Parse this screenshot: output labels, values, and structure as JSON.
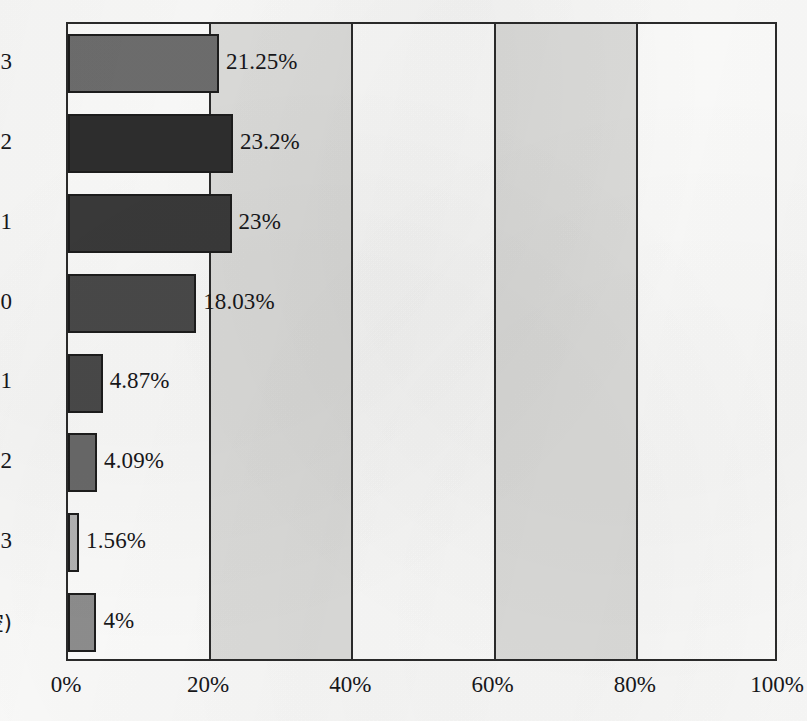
{
  "chart_data": {
    "type": "bar",
    "orientation": "horizontal",
    "title": "",
    "subtitle": "",
    "xlabel": "",
    "ylabel": "",
    "categories": [
      "3",
      "2",
      "1",
      "0",
      "−1",
      "−2",
      "−3",
      "(空)"
    ],
    "values": [
      21.25,
      23.2,
      23.0,
      18.03,
      4.87,
      4.09,
      1.56,
      4.0
    ],
    "data_labels": [
      "21.25%",
      "23.2%",
      "23%",
      "18.03%",
      "4.87%",
      "4.09%",
      "1.56%",
      "4%"
    ],
    "bar_colors": [
      "#6e6e6e",
      "#2e2e2e",
      "#3a3a3a",
      "#4a4a4a",
      "#4a4a4a",
      "#6a6a6a",
      "#b4b4b4",
      "#8e8e8e"
    ],
    "xlim": [
      0,
      100
    ],
    "ylim": [
      0,
      8
    ],
    "x_ticks": [
      0,
      20,
      40,
      60,
      80,
      100
    ],
    "x_tick_labels": [
      "0%",
      "20%",
      "40%",
      "60%",
      "80%",
      "100%"
    ],
    "grid": true,
    "gridlines_vertical_at": [
      20,
      40,
      60,
      80
    ],
    "alternating_bands": [
      {
        "from": 20,
        "to": 40,
        "color": "#dededc"
      },
      {
        "from": 60,
        "to": 80,
        "color": "#dededc"
      }
    ],
    "legend": null,
    "legend_position": "none",
    "annotations": [],
    "frame_color": "#2b2b2b",
    "plot_background": "#fdfdfc",
    "figure_background": "#fbfbfa"
  }
}
